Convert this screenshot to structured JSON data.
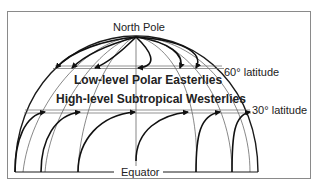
{
  "diagram": {
    "labels": {
      "north_pole": "North Pole",
      "lat60": "60° latitude",
      "lat30": "30° latitude",
      "equator": "Equator",
      "polar_easterlies": "Low-level Polar Easterlies",
      "subtropical_westerlies": "High-level Subtropical Westerlies"
    },
    "colors": {
      "line": "#1a1a1a",
      "thin_line": "#555555",
      "frame": "#8a8a8a",
      "background": "#ffffff"
    }
  }
}
